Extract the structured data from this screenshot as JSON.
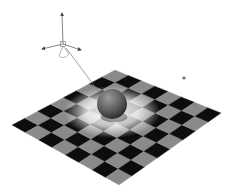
{
  "scene": {
    "label": "3D viewport: checkerboard plane with sphere and spotlight",
    "background": "#ffffff",
    "plane": {
      "rows": 8,
      "cols": 8,
      "corners": {
        "top": [
          115,
          70
        ],
        "right": [
          221,
          113
        ],
        "bottom": [
          119,
          185
        ],
        "left": [
          12,
          125
        ]
      },
      "dark_color": "#0d0d0d",
      "light_color": "#8a8a8a",
      "highlight_color": "#f2f2f2",
      "highlight_center": [
        112,
        112
      ],
      "highlight_radius": 42
    },
    "sphere": {
      "center": [
        112,
        104
      ],
      "radius": 15,
      "color_light": "#8c8c8c",
      "color_dark": "#2e2e2e"
    },
    "light_gizmo": {
      "center": [
        63,
        44
      ],
      "up_tip": [
        62,
        13
      ],
      "left_tip": [
        42,
        49
      ],
      "right_tip": [
        81,
        50
      ],
      "beam_end": [
        99,
        92
      ],
      "color": "#555555"
    },
    "point_marker": {
      "position": [
        184,
        78
      ],
      "radius": 1.6,
      "color": "#6a6a6a"
    }
  }
}
